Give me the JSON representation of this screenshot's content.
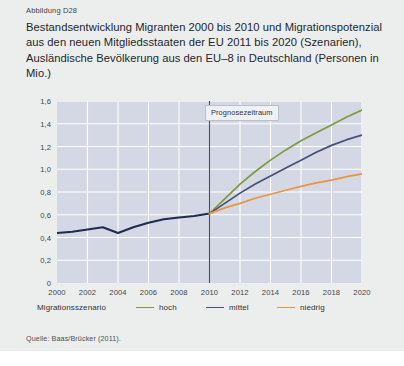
{
  "figure": {
    "label": "Abbildung D28",
    "title": "Bestandsentwicklung Migranten 2000 bis 2010 und Migrationspotenzial aus den neuen Mitgliedsstaaten der EU 2011 bis 2020 (Szenarien), Ausländische Bevölkerung aus den EU–8 in Deutschland (Personen in Mio.)",
    "source": "Quelle: Baas/Brücker (2011).",
    "annotation": "Prognosezeitraum"
  },
  "legend": {
    "title": "Migrationsszenario",
    "items": [
      {
        "label": "hoch",
        "color": "#7d9a3c"
      },
      {
        "label": "mittel",
        "color": "#44507a"
      },
      {
        "label": "niedrig",
        "color": "#e8953d"
      }
    ]
  },
  "colors": {
    "plot_background": "#d4d8e4",
    "gridline": "#ffffff",
    "historical_line": "#1e2a50",
    "divider": "#4a4f58",
    "page_background": "#eceeee"
  },
  "chart_data": {
    "type": "line",
    "title": "Bestandsentwicklung Migranten 2000 bis 2010 und Migrationspotenzial aus den neuen Mitgliedsstaaten der EU 2011 bis 2020 (Szenarien), Ausländische Bevölkerung aus den EU–8 in Deutschland (Personen in Mio.)",
    "xlabel": "",
    "ylabel": "Personen in Mio.",
    "xlim": [
      2000,
      2020
    ],
    "ylim": [
      0,
      1.6
    ],
    "grid": true,
    "legend_position": "bottom",
    "xtick_labels": [
      "2000",
      "2002",
      "2004",
      "2006",
      "2008",
      "2010",
      "2012",
      "2014",
      "2016",
      "2018",
      "2020"
    ],
    "xticks": [
      2000,
      2002,
      2004,
      2006,
      2008,
      2010,
      2012,
      2014,
      2016,
      2018,
      2020
    ],
    "ytick_labels": [
      "0",
      "0,2",
      "0,4",
      "0,6",
      "0,8",
      "1,0",
      "1,2",
      "1,4",
      "1,6"
    ],
    "yticks": [
      0,
      0.2,
      0.4,
      0.6,
      0.8,
      1.0,
      1.2,
      1.4,
      1.6
    ],
    "annotations": [
      {
        "text": "Prognosezeitraum",
        "x": 2010,
        "note": "vertical divider separating history from forecast"
      }
    ],
    "series": [
      {
        "name": "Bestand (historisch)",
        "color": "#1e2a50",
        "x": [
          2000,
          2001,
          2002,
          2003,
          2004,
          2005,
          2006,
          2007,
          2008,
          2009,
          2010
        ],
        "values": [
          0.44,
          0.45,
          0.47,
          0.49,
          0.44,
          0.49,
          0.53,
          0.56,
          0.575,
          0.59,
          0.61
        ]
      },
      {
        "name": "hoch",
        "color": "#7d9a3c",
        "x": [
          2010,
          2011,
          2012,
          2013,
          2014,
          2015,
          2016,
          2017,
          2018,
          2019,
          2020
        ],
        "values": [
          0.61,
          0.74,
          0.87,
          0.98,
          1.08,
          1.17,
          1.25,
          1.32,
          1.39,
          1.46,
          1.52
        ]
      },
      {
        "name": "mittel",
        "color": "#44507a",
        "x": [
          2010,
          2011,
          2012,
          2013,
          2014,
          2015,
          2016,
          2017,
          2018,
          2019,
          2020
        ],
        "values": [
          0.61,
          0.7,
          0.79,
          0.87,
          0.94,
          1.01,
          1.08,
          1.15,
          1.21,
          1.26,
          1.3
        ]
      },
      {
        "name": "niedrig",
        "color": "#e8953d",
        "x": [
          2010,
          2011,
          2012,
          2013,
          2014,
          2015,
          2016,
          2017,
          2018,
          2019,
          2020
        ],
        "values": [
          0.61,
          0.66,
          0.7,
          0.745,
          0.78,
          0.815,
          0.85,
          0.88,
          0.905,
          0.935,
          0.96
        ]
      }
    ]
  }
}
